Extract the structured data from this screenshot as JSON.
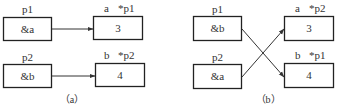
{
  "diagram_a": {
    "caption": "（a）",
    "p1": {
      "name": "p1",
      "value": "&a"
    },
    "p2": {
      "name": "p2",
      "value": "&b"
    },
    "a": {
      "name": "a",
      "alias": "*p1",
      "value": "3"
    },
    "b": {
      "name": "b",
      "alias": "*p2",
      "value": "4"
    },
    "edges": [
      {
        "from": "p1",
        "to": "a"
      },
      {
        "from": "p2",
        "to": "b"
      }
    ]
  },
  "diagram_b": {
    "caption": "（b）",
    "p1": {
      "name": "p1",
      "value": "&b"
    },
    "p2": {
      "name": "p2",
      "value": "&a"
    },
    "a": {
      "name": "a",
      "alias": "*p2",
      "value": "3"
    },
    "b": {
      "name": "b",
      "alias": "*p1",
      "value": "4"
    },
    "edges": [
      {
        "from": "p1",
        "to": "b"
      },
      {
        "from": "p2",
        "to": "a"
      }
    ]
  }
}
